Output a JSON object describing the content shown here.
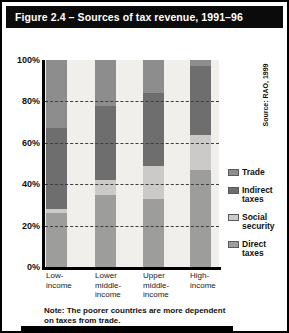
{
  "title_bar": {
    "title": "Figure 2.4 – Sources of tax revenue, 1991–96"
  },
  "source_note": "Source: RAO, 1999",
  "note": {
    "lines": [
      "Note: The poorer countries are more dependent",
      "on taxes from trade."
    ]
  },
  "colors": {
    "trade": "#8d8d8d",
    "indirect_taxes": "#6e6e6e",
    "social_security": "#cbcac8",
    "direct_taxes": "#9d9d9b",
    "plot_background": "#f0efec",
    "title_bar_background": "#0b0b0b",
    "title_bar_text": "#ffffff"
  },
  "chart_data": {
    "type": "bar",
    "stacked": true,
    "title": "Sources of tax revenue, 1991–96",
    "xlabel": "",
    "ylabel": "",
    "ylim": [
      0,
      100
    ],
    "grid": "dashed horizontal gridlines at 20/40/60/80, drawn over bars",
    "legend_position": "right",
    "categories": [
      "Low-income",
      "Lower middle-income",
      "Upper middle-income",
      "High-income"
    ],
    "category_label_lines": [
      [
        "Low-",
        "income"
      ],
      [
        "Lower",
        "middle-",
        "income"
      ],
      [
        "Upper",
        "middle-",
        "income"
      ],
      [
        "High-",
        "income"
      ]
    ],
    "series": [
      {
        "name": "Trade",
        "color": "#8d8d8d",
        "values": [
          33,
          22,
          16,
          3
        ]
      },
      {
        "name": "Indirect taxes",
        "color": "#6e6e6e",
        "values": [
          39,
          36,
          35,
          33
        ]
      },
      {
        "name": "Social security",
        "color": "#cbcac8",
        "values": [
          2,
          7,
          16,
          17
        ]
      },
      {
        "name": "Direct taxes",
        "color": "#9d9d9b",
        "values": [
          26,
          35,
          33,
          47
        ]
      }
    ],
    "y_ticks": [
      {
        "value": 100,
        "label": "100%"
      },
      {
        "value": 80,
        "label": "80%"
      },
      {
        "value": 60,
        "label": "60%"
      },
      {
        "value": 40,
        "label": "40%"
      },
      {
        "value": 20,
        "label": "20%"
      },
      {
        "value": 0,
        "label": "0%"
      }
    ]
  }
}
